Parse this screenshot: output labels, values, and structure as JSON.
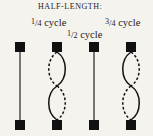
{
  "title": "HALF-LENGTH:",
  "labels": {
    "quarter": {
      "numerator": "1",
      "separator": "/",
      "denominator": "4",
      "word": "cycle"
    },
    "half": {
      "numerator": "1",
      "separator": "/",
      "denominator": "2",
      "word": "cycle"
    },
    "three_quarter": {
      "numerator": "3",
      "separator": "/",
      "denominator": "4",
      "word": "cycle"
    }
  },
  "colors": {
    "background": "#f5f3ee",
    "ink": "#121212",
    "text": "#25211c"
  },
  "chart_data": {
    "type": "diagram",
    "title": "HALF-LENGTH:",
    "annotations": [
      {
        "text": "1/4 cycle",
        "x": 31,
        "y": 18
      },
      {
        "text": "1/2 cycle",
        "x": 67,
        "y": 30
      },
      {
        "text": "3/4 cycle",
        "x": 105,
        "y": 18
      }
    ],
    "figures": [
      {
        "index": 1,
        "name": "straight-string",
        "state": "rest",
        "center_x": 20,
        "top_node_y": 7,
        "bottom_node_y": 85,
        "node_size": 10,
        "shape": "straight-line",
        "lobes": 0
      },
      {
        "index": 2,
        "name": "double-lobe-string-a",
        "state": "oscillating",
        "center_x": 57,
        "top_node_y": 7,
        "bottom_node_y": 85,
        "node_size": 10,
        "shape": "two-lens",
        "lobes": 2,
        "lobe_width": 11,
        "upper_left_style": "dashed",
        "upper_right_style": "solid",
        "lower_left_style": "solid",
        "lower_right_style": "dashed"
      },
      {
        "index": 3,
        "name": "straight-string-2",
        "state": "rest",
        "center_x": 94,
        "top_node_y": 7,
        "bottom_node_y": 85,
        "node_size": 10,
        "shape": "straight-line",
        "lobes": 0
      },
      {
        "index": 4,
        "name": "double-lobe-string-b",
        "state": "oscillating",
        "center_x": 131,
        "top_node_y": 7,
        "bottom_node_y": 85,
        "node_size": 10,
        "shape": "two-lens",
        "lobes": 2,
        "lobe_width": 11,
        "upper_left_style": "solid",
        "upper_right_style": "dashed",
        "lower_left_style": "dashed",
        "lower_right_style": "solid"
      }
    ]
  }
}
